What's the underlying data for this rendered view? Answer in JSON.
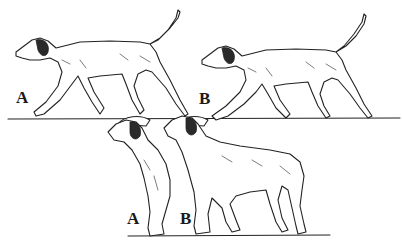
{
  "illustration": {
    "description": "Line drawing comparing dog gait and stance",
    "top_row": {
      "figures": [
        {
          "label": "A",
          "pose": "trotting"
        },
        {
          "label": "B",
          "pose": "trotting"
        }
      ]
    },
    "bottom_row": {
      "figures": [
        {
          "label": "A",
          "pose": "standing"
        },
        {
          "label": "B",
          "pose": "standing"
        }
      ]
    }
  }
}
